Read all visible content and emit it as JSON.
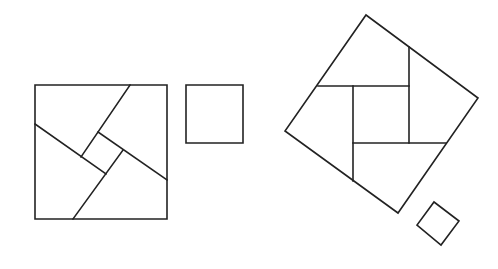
{
  "diagram": {
    "title": "",
    "stroke_color": "#222222",
    "background": "#ffffff",
    "figures": [
      {
        "id": "left-large-square",
        "outline": [
          [
            35,
            85
          ],
          [
            167,
            85
          ],
          [
            167,
            219
          ],
          [
            35,
            219
          ]
        ],
        "cuts": [
          [
            [
              130,
              85
            ],
            [
              81,
              157
            ]
          ],
          [
            [
              35,
              124
            ],
            [
              106,
              174
            ]
          ],
          [
            [
              98,
              132
            ],
            [
              167,
              180
            ]
          ],
          [
            [
              123,
              150
            ],
            [
              73,
              219
            ]
          ]
        ]
      },
      {
        "id": "left-small-square",
        "outline": [
          [
            186,
            85
          ],
          [
            243,
            85
          ],
          [
            243,
            143
          ],
          [
            186,
            143
          ]
        ],
        "cuts": []
      },
      {
        "id": "right-rotated-square",
        "outline": [
          [
            366,
            15
          ],
          [
            478,
            98
          ],
          [
            398,
            213
          ],
          [
            285,
            131
          ]
        ],
        "cuts": [
          [
            [
              318,
              86
            ],
            [
              409,
              86
            ]
          ],
          [
            [
              409,
              47
            ],
            [
              409,
              143
            ]
          ],
          [
            [
              353,
              143
            ],
            [
              446,
              143
            ]
          ],
          [
            [
              353,
              86
            ],
            [
              353,
              181
            ]
          ]
        ]
      },
      {
        "id": "right-small-diamond",
        "outline": [
          [
            434,
            202
          ],
          [
            459,
            221
          ],
          [
            441,
            245
          ],
          [
            417,
            225
          ]
        ],
        "cuts": []
      }
    ]
  }
}
